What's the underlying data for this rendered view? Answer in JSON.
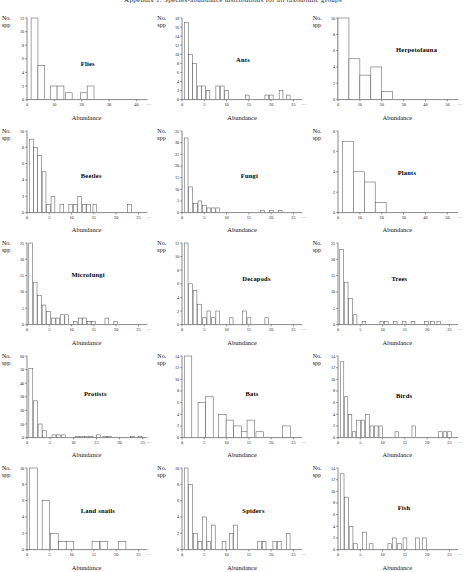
{
  "figure": {
    "title": "Appendix 1. Species-abundance distributions for all taxonomic groups",
    "y_axis_label_line1": "No.",
    "y_axis_label_line2": "spp",
    "x_axis_label": "Abundance",
    "axis_continuation_glyph": "…"
  },
  "chart_data": [
    {
      "type": "bar",
      "title": "Flies",
      "xlabel": "Abundance",
      "ylabel": "No. spp",
      "xlim": [
        0,
        44
      ],
      "ylim": [
        0,
        12
      ],
      "xticks": [
        0,
        10,
        20,
        30,
        40
      ],
      "yticks": [
        0,
        2,
        4,
        6,
        8,
        10,
        12
      ],
      "bin_width": 2.5,
      "bin_starts": [
        1.5,
        4.0,
        8.5,
        11.0,
        14.0,
        19.5,
        22.0
      ],
      "values": [
        12,
        5,
        2,
        2,
        1,
        1,
        2
      ],
      "title_pos": [
        0.52,
        0.45
      ]
    },
    {
      "type": "bar",
      "title": "Ants",
      "xlabel": "Abundance",
      "ylabel": "No. spp",
      "xlim": [
        0,
        27
      ],
      "ylim": [
        0,
        18
      ],
      "xticks": [
        0,
        5,
        10,
        15,
        20,
        25
      ],
      "yticks": [
        0,
        2,
        4,
        6,
        8,
        10,
        12,
        14,
        16,
        18
      ],
      "bin_width": 0.85,
      "bin_starts": [
        0.6,
        1.5,
        2.4,
        3.5,
        4.4,
        5.4,
        7.6,
        8.6,
        9.6,
        14.2,
        18.6,
        19.6,
        21.8,
        23.4
      ],
      "values": [
        17,
        10,
        8,
        3,
        3,
        2,
        3,
        3,
        2,
        1,
        1,
        1,
        2,
        1
      ],
      "title_pos": [
        0.52,
        0.42
      ]
    },
    {
      "type": "bar",
      "title": "Herpetofauna",
      "xlabel": "Abundance",
      "ylabel": "No. spp",
      "xlim": [
        0,
        55
      ],
      "ylim": [
        0,
        10
      ],
      "xticks": [
        0,
        10,
        20,
        30,
        40,
        50
      ],
      "yticks": [
        0,
        2,
        4,
        6,
        8,
        10
      ],
      "bin_width": 5,
      "bin_starts": [
        0,
        5,
        10,
        15,
        20
      ],
      "values": [
        10,
        5,
        3,
        4,
        1
      ],
      "title_pos": [
        0.55,
        0.33
      ]
    },
    {
      "type": "bar",
      "title": "Beetles",
      "xlabel": "Abundance",
      "ylabel": "No. spp",
      "xlim": [
        0,
        27
      ],
      "ylim": [
        0,
        10
      ],
      "xticks": [
        0,
        5,
        10,
        15,
        20,
        25
      ],
      "yticks": [
        0,
        2,
        4,
        6,
        8,
        10
      ],
      "bin_width": 0.85,
      "bin_starts": [
        0.6,
        1.5,
        2.4,
        3.4,
        4.4,
        5.4,
        7.4,
        9.4,
        10.4,
        11.4,
        12.4,
        13.4,
        14.8,
        22.6
      ],
      "values": [
        9,
        8,
        7,
        5,
        1,
        2,
        1,
        1,
        1,
        2,
        1,
        1,
        1,
        1
      ],
      "title_pos": [
        0.52,
        0.45
      ]
    },
    {
      "type": "bar",
      "title": "Fungi",
      "xlabel": "Abundance",
      "ylabel": "No. spp",
      "xlim": [
        0,
        27
      ],
      "ylim": [
        0,
        35
      ],
      "xticks": [
        0,
        5,
        10,
        15,
        20,
        25
      ],
      "yticks": [
        0,
        5,
        10,
        15,
        20,
        25,
        30,
        35
      ],
      "bin_width": 0.85,
      "bin_starts": [
        0.5,
        1.5,
        2.6,
        3.6,
        4.6,
        5.6,
        6.6,
        7.6,
        17.6,
        19.6,
        21.6
      ],
      "values": [
        32,
        11,
        4,
        5,
        3,
        2,
        2,
        2,
        1,
        1,
        1
      ],
      "title_pos": [
        0.55,
        0.45
      ]
    },
    {
      "type": "bar",
      "title": "Plants",
      "xlabel": "Abundance",
      "ylabel": "No. spp",
      "xlim": [
        0,
        55
      ],
      "ylim": [
        0,
        8
      ],
      "xticks": [
        0,
        10,
        20,
        30,
        40,
        50
      ],
      "yticks": [
        0,
        2,
        4,
        6,
        8
      ],
      "bin_width": 5,
      "bin_starts": [
        2,
        7,
        12,
        17
      ],
      "values": [
        7,
        4,
        3,
        1
      ],
      "title_pos": [
        0.56,
        0.42
      ]
    },
    {
      "type": "bar",
      "title": "Microfungi",
      "xlabel": "Abundance",
      "ylabel": "No. spp",
      "xlim": [
        0,
        27
      ],
      "ylim": [
        0,
        25
      ],
      "xticks": [
        0,
        5,
        10,
        15,
        20,
        25
      ],
      "yticks": [
        0,
        5,
        10,
        15,
        20,
        25
      ],
      "bin_width": 0.85,
      "bin_starts": [
        0.4,
        1.4,
        2.4,
        3.4,
        4.4,
        5.5,
        6.5,
        7.5,
        8.5,
        10.4,
        11.5,
        12.5,
        13.5,
        14.5,
        17.5,
        19.5
      ],
      "values": [
        25,
        13,
        9,
        6,
        4,
        2,
        2,
        3,
        3,
        1,
        2,
        2,
        1,
        1,
        2,
        1
      ],
      "title_pos": [
        0.46,
        0.33
      ]
    },
    {
      "type": "bar",
      "title": "Decapods",
      "xlabel": "Abundance",
      "ylabel": "No. spp",
      "xlim": [
        0,
        27
      ],
      "ylim": [
        0,
        12
      ],
      "xticks": [
        0,
        5,
        10,
        15,
        20,
        25
      ],
      "yticks": [
        0,
        2,
        4,
        6,
        8,
        10,
        12
      ],
      "bin_width": 0.85,
      "bin_starts": [
        0.5,
        1.5,
        2.5,
        3.5,
        4.6,
        5.6,
        6.6,
        7.6,
        10.6,
        13.6,
        14.6,
        18.6
      ],
      "values": [
        12,
        6,
        5,
        3,
        1,
        2,
        1,
        2,
        1,
        2,
        1,
        1
      ],
      "title_pos": [
        0.56,
        0.36
      ]
    },
    {
      "type": "bar",
      "title": "Trees",
      "xlabel": "Abundance",
      "ylabel": "No. spp",
      "xlim": [
        0,
        27
      ],
      "ylim": [
        0,
        25
      ],
      "xticks": [
        0,
        5,
        10,
        15,
        20,
        25
      ],
      "yticks": [
        0,
        5,
        10,
        15,
        20,
        25
      ],
      "bin_width": 0.85,
      "bin_starts": [
        0.4,
        1.4,
        2.4,
        3.4,
        5.4,
        9.4,
        10.4,
        12.4,
        14.4,
        16.4,
        19.4,
        20.8,
        22.2
      ],
      "values": [
        23,
        13,
        8,
        3,
        1,
        1,
        1,
        1,
        1,
        1,
        1,
        1,
        1
      ],
      "title_pos": [
        0.52,
        0.36
      ]
    },
    {
      "type": "bar",
      "title": "Protists",
      "xlabel": "Abundance",
      "ylabel": "No. spp",
      "xlim": [
        0,
        26
      ],
      "ylim": [
        0,
        60
      ],
      "xticks": [
        0,
        5,
        10,
        15,
        20,
        25
      ],
      "yticks": [
        0,
        10,
        20,
        30,
        40,
        50,
        60
      ],
      "bin_width": 0.85,
      "bin_starts": [
        0.4,
        1.4,
        2.4,
        3.4,
        5.4,
        6.4,
        7.4,
        10.4,
        11.4,
        12.4,
        13.4,
        15.0,
        16.4,
        17.4,
        22.4,
        24.0
      ],
      "values": [
        51,
        27,
        10,
        5,
        2,
        2,
        2,
        1,
        1,
        1,
        1,
        2,
        1,
        1,
        1,
        1
      ],
      "title_pos": [
        0.54,
        0.38
      ]
    },
    {
      "type": "bar",
      "title": "Bats",
      "xlabel": "Abundance",
      "ylabel": "No. spp",
      "xlim": [
        0,
        27
      ],
      "ylim": [
        0,
        14
      ],
      "xticks": [
        0,
        5,
        10,
        15,
        20,
        25
      ],
      "yticks": [
        0,
        2,
        4,
        6,
        8,
        10,
        12,
        14
      ],
      "bin_width": 1.7,
      "bin_starts": [
        0.5,
        3.6,
        5.3,
        8.2,
        9.9,
        11.6,
        13.3,
        14.6,
        16.6,
        22.6
      ],
      "values": [
        14,
        6,
        7,
        4,
        3,
        2,
        1,
        3,
        1,
        2
      ],
      "title_pos": [
        0.58,
        0.38
      ]
    },
    {
      "type": "bar",
      "title": "Birds",
      "xlabel": "Abundance",
      "ylabel": "No. spp",
      "xlim": [
        0,
        27
      ],
      "ylim": [
        0,
        14
      ],
      "xticks": [
        0,
        5,
        10,
        15,
        20,
        25
      ],
      "yticks": [
        0,
        2,
        4,
        6,
        8,
        10,
        12,
        14
      ],
      "bin_width": 0.8,
      "bin_starts": [
        0.5,
        1.4,
        2.3,
        3.2,
        4.2,
        5.2,
        6.2,
        7.2,
        8.2,
        9.2,
        12.8,
        16.6,
        22.6,
        23.6,
        24.6
      ],
      "values": [
        13,
        7,
        4,
        1,
        3,
        3,
        4,
        2,
        2,
        2,
        1,
        2,
        1,
        1,
        1
      ],
      "title_pos": [
        0.55,
        0.4
      ]
    },
    {
      "type": "bar",
      "title": "Land snails",
      "xlabel": "Abundance",
      "ylabel": "No. spp",
      "xlim": [
        0,
        27
      ],
      "ylim": [
        0,
        10
      ],
      "xticks": [
        0,
        5,
        10,
        15,
        20,
        25
      ],
      "yticks": [
        0,
        2,
        4,
        6,
        8,
        10
      ],
      "bin_width": 1.7,
      "bin_starts": [
        0.6,
        3.4,
        5.3,
        7.1,
        8.8,
        14.6,
        16.4,
        20.5
      ],
      "values": [
        10,
        6,
        2,
        1,
        1,
        1,
        1,
        1
      ],
      "title_pos": [
        0.52,
        0.42
      ]
    },
    {
      "type": "bar",
      "title": "Spiders",
      "xlabel": "Abundance",
      "ylabel": "No. spp",
      "xlim": [
        0,
        27
      ],
      "ylim": [
        0,
        10
      ],
      "xticks": [
        0,
        5,
        10,
        15,
        20,
        25
      ],
      "yticks": [
        0,
        2,
        4,
        6,
        8,
        10
      ],
      "bin_width": 0.85,
      "bin_starts": [
        0.5,
        1.5,
        2.6,
        3.6,
        4.6,
        5.6,
        6.6,
        9.0,
        10.6,
        11.6,
        17.0,
        18.0,
        20.4,
        21.4,
        23.4
      ],
      "values": [
        10,
        8,
        2,
        1,
        4,
        1,
        3,
        1,
        2,
        3,
        1,
        1,
        1,
        1,
        2
      ],
      "title_pos": [
        0.56,
        0.42
      ]
    },
    {
      "type": "bar",
      "title": "Fish",
      "xlabel": "Abundance",
      "ylabel": "No. spp",
      "xlim": [
        0,
        27
      ],
      "ylim": [
        0,
        14
      ],
      "xticks": [
        0,
        5,
        10,
        15,
        20,
        25
      ],
      "yticks": [
        0,
        2,
        4,
        6,
        8,
        10,
        12,
        14
      ],
      "bin_width": 0.85,
      "bin_starts": [
        0.5,
        1.5,
        2.5,
        3.5,
        5.5,
        7.0,
        11.2,
        12.2,
        13.4,
        14.6,
        17.4,
        19.0
      ],
      "values": [
        13,
        9,
        4,
        1,
        3,
        1,
        1,
        2,
        1,
        2,
        2,
        2
      ],
      "title_pos": [
        0.56,
        0.4
      ]
    }
  ]
}
